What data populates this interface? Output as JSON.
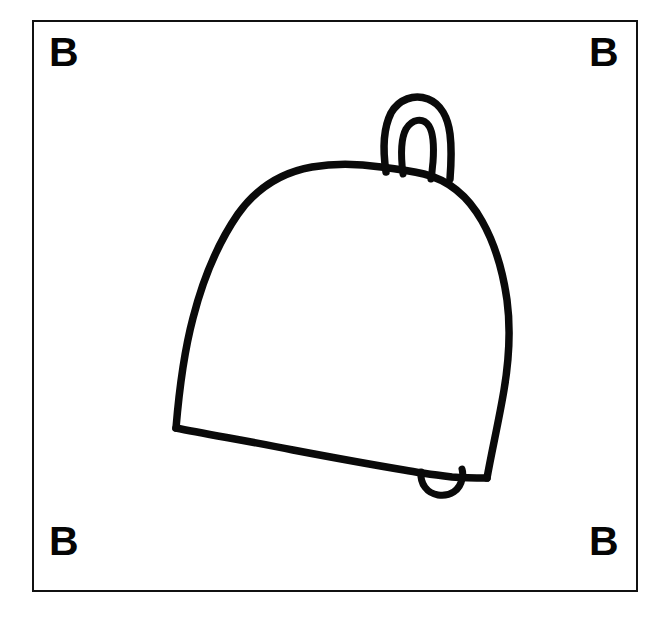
{
  "canvas": {
    "width": 664,
    "height": 619,
    "background_color": "#ffffff"
  },
  "card": {
    "frame": {
      "x": 32,
      "y": 20,
      "width": 606,
      "height": 572,
      "border_color": "#111111",
      "border_width": 2,
      "fill_color": "#ffffff"
    },
    "corner_letters": [
      {
        "position": "top-left",
        "label": "B"
      },
      {
        "position": "top-right",
        "label": "B"
      },
      {
        "position": "bottom-left",
        "label": "B"
      },
      {
        "position": "bottom-right",
        "label": "B"
      }
    ]
  },
  "drawing": {
    "subject": "bell",
    "style": "hand-drawn black ink outline, unfilled",
    "stroke_color": "#0a0a0a",
    "stroke_width": 7,
    "parts": [
      {
        "name": "handle-outer-loop",
        "description": "outer arch loop on top of the dome"
      },
      {
        "name": "handle-inner-loop",
        "description": "inner arch loop nested inside the outer loop"
      },
      {
        "name": "bell-dome-body",
        "description": "rounded dome flaring out to a wide rim"
      },
      {
        "name": "bell-rim",
        "description": "slanted bottom rim line, lower on the right"
      },
      {
        "name": "bell-clapper",
        "description": "small U-shaped bump hanging below the rim"
      }
    ]
  }
}
